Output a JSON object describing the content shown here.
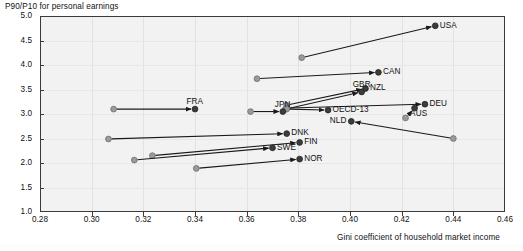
{
  "chart_data": {
    "type": "scatter",
    "title": "",
    "ylabel": "P90/P10 for personal earnings",
    "xlabel": "Gini coefficient of household market income",
    "xlim": [
      0.28,
      0.46
    ],
    "ylim": [
      1.0,
      5.0
    ],
    "xticks": [
      "0.28",
      "0.30",
      "0.32",
      "0.34",
      "0.36",
      "0.38",
      "0.40",
      "0.42",
      "0.44",
      "0.46"
    ],
    "xtick_values": [
      0.28,
      0.3,
      0.32,
      0.34,
      0.36,
      0.38,
      0.4,
      0.42,
      0.44,
      0.46
    ],
    "yticks": [
      "1.0",
      "1.5",
      "2.0",
      "2.5",
      "3.0",
      "3.5",
      "4.0",
      "4.5",
      "5.0"
    ],
    "ytick_values": [
      1.0,
      1.5,
      2.0,
      2.5,
      3.0,
      3.5,
      4.0,
      4.5,
      5.0
    ],
    "grid": true,
    "legend": "none",
    "series_note": "Each country is drawn as an arrow from an earlier observation (open grey dot) to a later observation (filled dark dot, labelled).",
    "points": [
      {
        "label": "USA",
        "x_start": 0.3813,
        "y_start": 4.15,
        "x_end": 0.433,
        "y_end": 4.8,
        "label_pos": "right"
      },
      {
        "label": "CAN",
        "x_start": 0.364,
        "y_start": 3.72,
        "x_end": 0.411,
        "y_end": 3.85,
        "label_pos": "right"
      },
      {
        "label": "NZL",
        "x_start": 0.3755,
        "y_start": 3.18,
        "x_end": 0.406,
        "y_end": 3.52,
        "label_pos": "right"
      },
      {
        "label": "GBR",
        "x_start": 0.375,
        "y_start": 3.1,
        "x_end": 0.4045,
        "y_end": 3.45,
        "label_pos": "above"
      },
      {
        "label": "DEU",
        "x_start": 0.3755,
        "y_start": 3.12,
        "x_end": 0.429,
        "y_end": 3.2,
        "label_pos": "right"
      },
      {
        "label": "AUS",
        "x_start": 0.4215,
        "y_start": 2.92,
        "x_end": 0.425,
        "y_end": 3.12,
        "label_pos": "below"
      },
      {
        "label": "OECD-13",
        "x_start": 0.3755,
        "y_start": 3.1,
        "x_end": 0.3915,
        "y_end": 3.08,
        "label_pos": "right"
      },
      {
        "label": "JPN",
        "x_start": 0.3615,
        "y_start": 3.05,
        "x_end": 0.374,
        "y_end": 3.05,
        "label_pos": "above"
      },
      {
        "label": "FRA",
        "x_start": 0.3085,
        "y_start": 3.1,
        "x_end": 0.34,
        "y_end": 3.1,
        "label_pos": "above"
      },
      {
        "label": "NLD",
        "x_start": 0.44,
        "y_start": 2.5,
        "x_end": 0.4005,
        "y_end": 2.85,
        "label_pos": "left"
      },
      {
        "label": "DNK",
        "x_start": 0.3065,
        "y_start": 2.49,
        "x_end": 0.3755,
        "y_end": 2.6,
        "label_pos": "right"
      },
      {
        "label": "FIN",
        "x_start": 0.3235,
        "y_start": 2.15,
        "x_end": 0.3805,
        "y_end": 2.42,
        "label_pos": "right"
      },
      {
        "label": "SWE",
        "x_start": 0.3165,
        "y_start": 2.06,
        "x_end": 0.37,
        "y_end": 2.31,
        "label_pos": "right"
      },
      {
        "label": "NOR",
        "x_start": 0.3405,
        "y_start": 1.89,
        "x_end": 0.3805,
        "y_end": 2.08,
        "label_pos": "right"
      }
    ]
  },
  "axes": {
    "y_axis_title": "P90/P10 for personal earnings",
    "x_axis_title": "Gini coefficient of household market income"
  },
  "colors": {
    "plot_background": "#f2f2f2",
    "axis_line": "#3a3a3a",
    "grid_line": "#e4e4e4",
    "arrow": "#1a1a1a",
    "start_marker": "#9a9a9a",
    "end_marker": "#3c3c3c",
    "text": "#111111"
  }
}
